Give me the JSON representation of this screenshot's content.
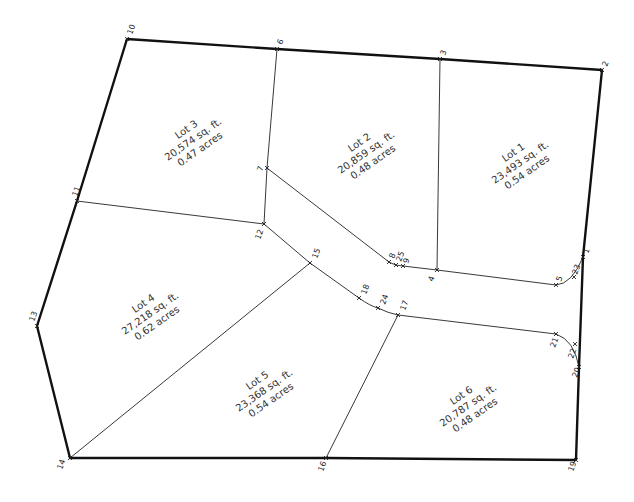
{
  "lots": [
    {
      "name": "Lot 1",
      "area": "23,493  sq.  ft.",
      "acres": "0.54  acres"
    },
    {
      "name": "Lot 2",
      "area": "20,859  sq.  ft.",
      "acres": "0.48  acres"
    },
    {
      "name": "Lot 3",
      "area": "20,574  sq.  ft.",
      "acres": "0.47  acres"
    },
    {
      "name": "Lot 4",
      "area": "27,218  sq.  ft.",
      "acres": "0.62  acres"
    },
    {
      "name": "Lot 5",
      "area": "23,368  sq.  ft.",
      "acres": "0.54  acres"
    },
    {
      "name": "Lot 6",
      "area": "20,787  sq.  ft.",
      "acres": "0.48  acres"
    }
  ],
  "points": {
    "p1": "1",
    "p2": "2",
    "p3": "3",
    "p4": "4",
    "p5": "5",
    "p6": "6",
    "p7": "7",
    "p8": "8",
    "p9": "9",
    "p10": "10",
    "p11": "11",
    "p12": "12",
    "p13": "13",
    "p14": "14",
    "p15": "15",
    "p16": "16",
    "p17": "17",
    "p18": "18",
    "p19": "19",
    "p20": "20",
    "p21": "21",
    "p22": "22",
    "p23": "23",
    "p24": "24",
    "p25": "25"
  },
  "colors": {
    "line": "#111111",
    "background": "#ffffff"
  }
}
